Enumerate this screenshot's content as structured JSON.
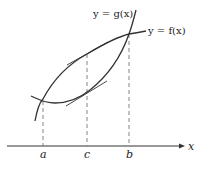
{
  "diagram": {
    "curves": [
      {
        "name": "g",
        "label": "y = g(x)"
      },
      {
        "name": "f",
        "label": "y = f(x)"
      }
    ],
    "axis": {
      "label": "x"
    },
    "ticks": [
      {
        "label": "a"
      },
      {
        "label": "c"
      },
      {
        "label": "b"
      }
    ],
    "colors": {
      "stroke": "#333333",
      "dashed": "#777777",
      "background": "#ffffff"
    }
  }
}
